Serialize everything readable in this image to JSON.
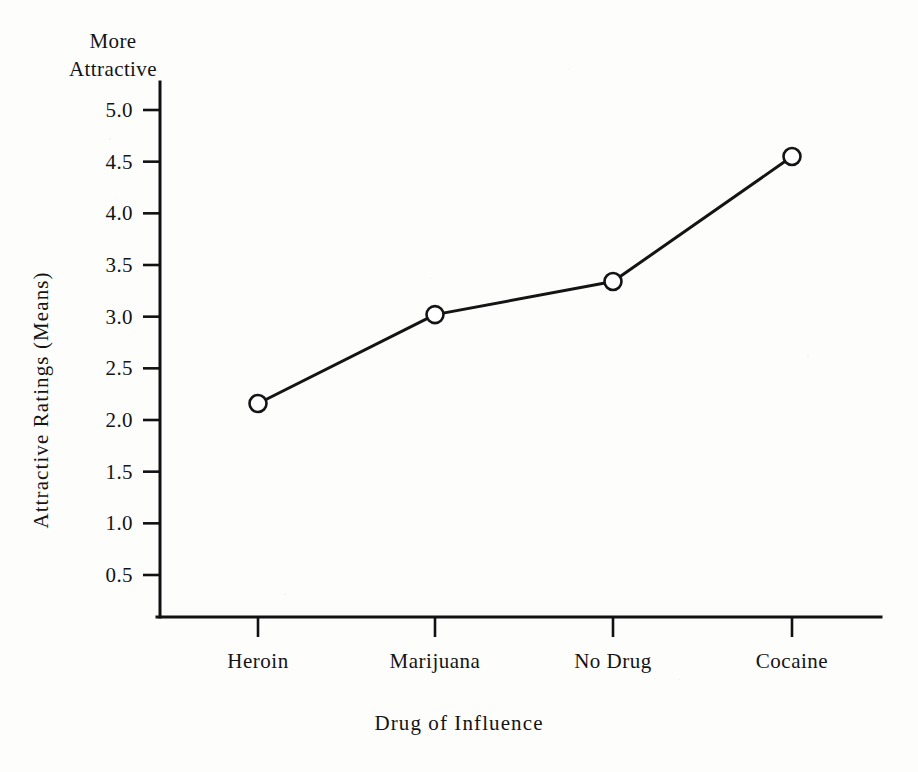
{
  "chart_data": {
    "type": "line",
    "title": "",
    "categories": [
      "Heroin",
      "Marijuana",
      "No Drug",
      "Cocaine"
    ],
    "values": [
      2.16,
      3.02,
      3.34,
      4.55
    ],
    "series": [
      {
        "name": "Attractive Ratings (Means)",
        "values": [
          2.16,
          3.02,
          3.34,
          4.55
        ]
      }
    ],
    "xlabel": "Drug of Influence",
    "ylabel": "Attractive Ratings (Means)",
    "ylim": [
      0,
      5.0
    ],
    "ytick_labels": [
      "5.0",
      "4.5",
      "4.0",
      "3.5",
      "3.0",
      "2.5",
      "2.0",
      "1.5",
      "1.0",
      "0.5"
    ],
    "ytick_values": [
      5.0,
      4.5,
      4.0,
      3.5,
      3.0,
      2.5,
      2.0,
      1.5,
      1.0,
      0.5
    ],
    "grid": false,
    "legend": false,
    "marker": "open-circle",
    "annotations": {
      "y_axis_top_anchor_line1": "More",
      "y_axis_top_anchor_line2": "Attractive"
    },
    "colors": {
      "line": "#141414",
      "marker_fill": "#ffffff",
      "marker_stroke": "#141414",
      "axis": "#111111",
      "background": "#fdfdfc",
      "text": "#141414"
    }
  }
}
